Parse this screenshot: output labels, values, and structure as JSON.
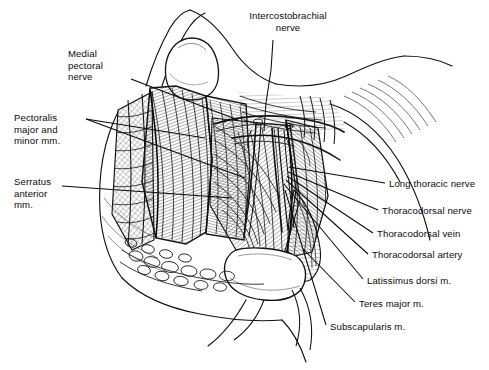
{
  "figure": {
    "style": "pen-and-ink line drawing, black on white",
    "width": 489,
    "height": 370,
    "background_color": "#ffffff",
    "ink_color": "#111111"
  },
  "labels": {
    "intercostobrachial_nerve": "Intercostobrachial\nnerve",
    "medial_pectoral_nerve": "Medial\npectoral\nnerve",
    "pectoralis": "Pectoralis\nmajor and\nminor mm.",
    "serratus_anterior": "Serratus\nanterior\nmm.",
    "long_thoracic_nerve": "Long thoracic nerve",
    "thoracodorsal_nerve": "Thoracodorsal nerve",
    "thoracodorsal_vein": "Thoracodorsal vein",
    "thoracodorsal_artery": "Thoracodorsal artery",
    "latissimus_dorsi": "Latissimus dorsi m.",
    "teres_major": "Teres major m.",
    "subscapularis": "Subscapularis m."
  },
  "label_positions": {
    "intercostobrachial_nerve": {
      "x": 228,
      "y": 10,
      "align": "center",
      "width": 120
    },
    "medial_pectoral_nerve": {
      "x": 68,
      "y": 48,
      "align": "left",
      "width": 70
    },
    "pectoralis": {
      "x": 14,
      "y": 112,
      "align": "left",
      "width": 80
    },
    "serratus_anterior": {
      "x": 14,
      "y": 176,
      "align": "left",
      "width": 70
    },
    "long_thoracic_nerve": {
      "x": 389,
      "y": 178,
      "align": "left",
      "width": 100
    },
    "thoracodorsal_nerve": {
      "x": 382,
      "y": 205,
      "align": "left",
      "width": 107
    },
    "thoracodorsal_vein": {
      "x": 377,
      "y": 228,
      "align": "left",
      "width": 112
    },
    "thoracodorsal_artery": {
      "x": 372,
      "y": 249,
      "align": "left",
      "width": 117
    },
    "latissimus_dorsi": {
      "x": 367,
      "y": 275,
      "align": "left",
      "width": 122
    },
    "teres_major": {
      "x": 359,
      "y": 298,
      "align": "left",
      "width": 130
    },
    "subscapularis": {
      "x": 330,
      "y": 321,
      "align": "left",
      "width": 159
    }
  },
  "leader_lines": [
    {
      "name": "intercostobrachial-nerve-leader",
      "points": "273,40 271,70 266,103 264,131"
    },
    {
      "name": "medial-pectoral-nerve-leader",
      "points": "131,79 238,120"
    },
    {
      "name": "pectoralis-leader-upper",
      "points": "86,119 205,138"
    },
    {
      "name": "pectoralis-leader-lower",
      "points": "86,119 245,178"
    },
    {
      "name": "serratus-anterior-leader",
      "points": "62,186 232,198"
    },
    {
      "name": "long-thoracic-nerve-leader",
      "points": "385,183 289,167"
    },
    {
      "name": "thoracodorsal-nerve-leader",
      "points": "378,210 288,172"
    },
    {
      "name": "thoracodorsal-vein-leader",
      "points": "373,233 287,176"
    },
    {
      "name": "thoracodorsal-artery-leader",
      "points": "368,254 286,180"
    },
    {
      "name": "latissimus-dorsi-leader",
      "points": "363,279 284,184"
    },
    {
      "name": "teres-major-leader",
      "points": "355,302 303,249"
    },
    {
      "name": "subscapularis-leader",
      "points": "326,325 285,190"
    }
  ],
  "structures": [
    {
      "name": "upper-arm",
      "description": "upper arm retracted superolaterally, upper right of frame"
    },
    {
      "name": "chest-wall",
      "description": "lateral chest wall, lower left of frame"
    },
    {
      "name": "retractor-blade-superior",
      "description": "white retractor blade at superior wound edge"
    },
    {
      "name": "retractor-blade-inferior",
      "description": "white retractor blade at inferior wound edge"
    },
    {
      "name": "pectoralis-major-minor",
      "description": "pectoral muscles reflected along medial wound edge"
    },
    {
      "name": "serratus-anterior",
      "description": "serratus anterior slips on chest wall"
    },
    {
      "name": "subcutaneous-fat",
      "description": "lobulated subcutaneous fat along inferior flap"
    },
    {
      "name": "axillary-vessels-nerves",
      "description": "neurovascular bundle crossing axillary cavity"
    },
    {
      "name": "latissimus-dorsi",
      "description": "latissimus dorsi forming lateral wound border"
    }
  ]
}
